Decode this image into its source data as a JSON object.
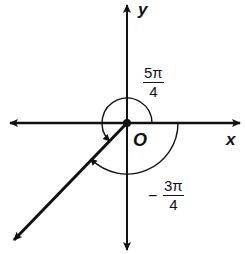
{
  "diagram": {
    "type": "angle-on-coordinate-plane",
    "axes": {
      "x_label": "x",
      "y_label": "y",
      "origin_label": "O"
    },
    "angles": [
      {
        "name": "positive-angle",
        "numerator": "5π",
        "denominator": "4",
        "sign": ""
      },
      {
        "name": "negative-angle",
        "numerator": "3π",
        "denominator": "4",
        "sign": "−"
      }
    ],
    "terminal_ray_direction_deg": 225,
    "colors": {
      "ink": "#111111",
      "background": "#ffffff"
    }
  }
}
